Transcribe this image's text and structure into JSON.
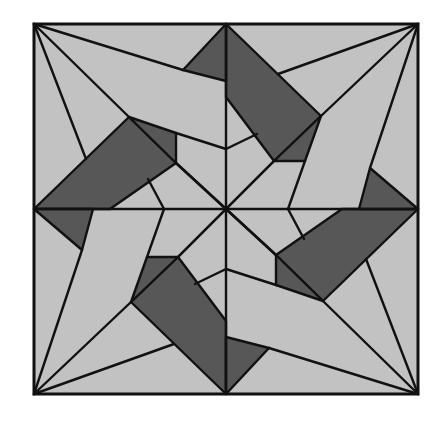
{
  "figure": {
    "type": "geometric quilt block",
    "symmetry": "4-fold rotational",
    "colors": {
      "background": "#ffffff",
      "light_fill": "#c2c2c2",
      "dark_fill": "#575757",
      "stroke": "#111111"
    },
    "square": {
      "x1": 34,
      "y1": 24,
      "x2": 418,
      "y2": 394
    },
    "center": [
      226,
      209
    ],
    "quadrants": [
      {
        "name": "top",
        "parallelogram": [
          [
            226,
            24
          ],
          [
            321,
            116
          ],
          [
            274,
            161
          ],
          [
            226,
            97
          ]
        ],
        "small_triangle": [
          [
            274,
            161
          ],
          [
            305,
            161
          ],
          [
            321,
            116
          ]
        ],
        "edge_triangle": [
          [
            226,
            24
          ],
          [
            183,
            70
          ],
          [
            226,
            81
          ]
        ],
        "lines": [
          [
            [
              34,
              24
            ],
            [
              183,
              70
            ]
          ],
          [
            [
              418,
              24
            ],
            [
              321,
              116
            ]
          ],
          [
            [
              418,
              24
            ],
            [
              278,
              74
            ]
          ],
          [
            [
              274,
              161
            ],
            [
              226,
              209
            ]
          ],
          [
            [
              305,
              161
            ],
            [
              288,
              209
            ]
          ],
          [
            [
              226,
              149
            ],
            [
              257,
              134
            ]
          ]
        ]
      },
      {
        "name": "right",
        "parallelogram": [
          [
            418,
            209
          ],
          [
            323,
            301
          ],
          [
            276,
            255
          ],
          [
            342,
            209
          ]
        ],
        "small_triangle": [
          [
            276,
            255
          ],
          [
            276,
            285
          ],
          [
            323,
            301
          ]
        ],
        "edge_triangle": [
          [
            418,
            209
          ],
          [
            370,
            168
          ],
          [
            359,
            209
          ]
        ],
        "lines": [
          [
            [
              418,
              24
            ],
            [
              370,
              168
            ]
          ],
          [
            [
              418,
              394
            ],
            [
              323,
              301
            ]
          ],
          [
            [
              418,
              394
            ],
            [
              366,
              259
            ]
          ],
          [
            [
              276,
              255
            ],
            [
              226,
              209
            ]
          ],
          [
            [
              276,
              285
            ],
            [
              226,
              269
            ]
          ],
          [
            [
              288,
              209
            ],
            [
              304,
              239
            ]
          ]
        ]
      },
      {
        "name": "bottom",
        "parallelogram": [
          [
            226,
            394
          ],
          [
            131,
            302
          ],
          [
            178,
            257
          ],
          [
            226,
            321
          ]
        ],
        "small_triangle": [
          [
            178,
            257
          ],
          [
            147,
            257
          ],
          [
            131,
            302
          ]
        ],
        "edge_triangle": [
          [
            226,
            394
          ],
          [
            269,
            348
          ],
          [
            226,
            337
          ]
        ],
        "lines": [
          [
            [
              418,
              394
            ],
            [
              269,
              348
            ]
          ],
          [
            [
              34,
              394
            ],
            [
              131,
              302
            ]
          ],
          [
            [
              34,
              394
            ],
            [
              174,
              344
            ]
          ],
          [
            [
              178,
              257
            ],
            [
              226,
              209
            ]
          ],
          [
            [
              147,
              257
            ],
            [
              164,
              209
            ]
          ],
          [
            [
              226,
              269
            ],
            [
              195,
              284
            ]
          ]
        ]
      },
      {
        "name": "left",
        "parallelogram": [
          [
            34,
            209
          ],
          [
            129,
            117
          ],
          [
            176,
            163
          ],
          [
            110,
            209
          ]
        ],
        "small_triangle": [
          [
            176,
            163
          ],
          [
            176,
            133
          ],
          [
            129,
            117
          ]
        ],
        "edge_triangle": [
          [
            34,
            209
          ],
          [
            82,
            250
          ],
          [
            93,
            209
          ]
        ],
        "lines": [
          [
            [
              34,
              394
            ],
            [
              82,
              250
            ]
          ],
          [
            [
              34,
              24
            ],
            [
              129,
              117
            ]
          ],
          [
            [
              34,
              24
            ],
            [
              86,
              159
            ]
          ],
          [
            [
              176,
              163
            ],
            [
              226,
              209
            ]
          ],
          [
            [
              176,
              133
            ],
            [
              226,
              149
            ]
          ],
          [
            [
              164,
              209
            ],
            [
              148,
              179
            ]
          ]
        ]
      }
    ],
    "axes": [
      [
        [
          226,
          24
        ],
        [
          226,
          394
        ]
      ],
      [
        [
          34,
          209
        ],
        [
          418,
          209
        ]
      ]
    ],
    "diagonals": [
      [
        [
          274,
          161
        ],
        [
          178,
          257
        ]
      ],
      [
        [
          176,
          163
        ],
        [
          276,
          255
        ]
      ]
    ]
  }
}
